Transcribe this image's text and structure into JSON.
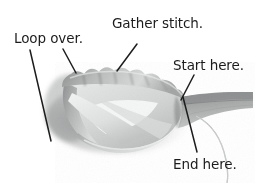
{
  "figure": {
    "background_color": "#ffffff",
    "text_color": "#1c1c1c",
    "width": 261,
    "height": 183
  },
  "callouts": {
    "loop_over": "Loop over.",
    "gather_stitch": "Gather stitch.",
    "start_here": "Start here.",
    "end_here": "End here."
  },
  "leader_lines": [
    {
      "name": "loop-over-leader-long",
      "x1": 30,
      "y1": 50,
      "x2": 51,
      "y2": 141
    },
    {
      "name": "loop-over-leader-short",
      "x1": 63,
      "y1": 49,
      "x2": 76,
      "y2": 73
    },
    {
      "name": "gather-stitch-leader",
      "x1": 137,
      "y1": 44,
      "x2": 117,
      "y2": 71
    },
    {
      "name": "start-here-leader",
      "x1": 194,
      "y1": 75,
      "x2": 181,
      "y2": 100
    },
    {
      "name": "end-here-leader",
      "x1": 183,
      "y1": 97,
      "x2": 197,
      "y2": 152
    }
  ],
  "ribbon": {
    "body_fill_light": "#e9eaea",
    "body_fill_mid": "#cfd1d1",
    "body_fill_dark": "#9a9c9c",
    "edge_shadow": "#7d7f80",
    "tail_fill": "#a9abab",
    "thread_color": "#b9bbbb",
    "parts": [
      "gathered-ruffled-top-edge",
      "twisted-loop-body",
      "crossing-band",
      "lower-rim",
      "flat-tail-right",
      "needle-thread-curve"
    ]
  }
}
